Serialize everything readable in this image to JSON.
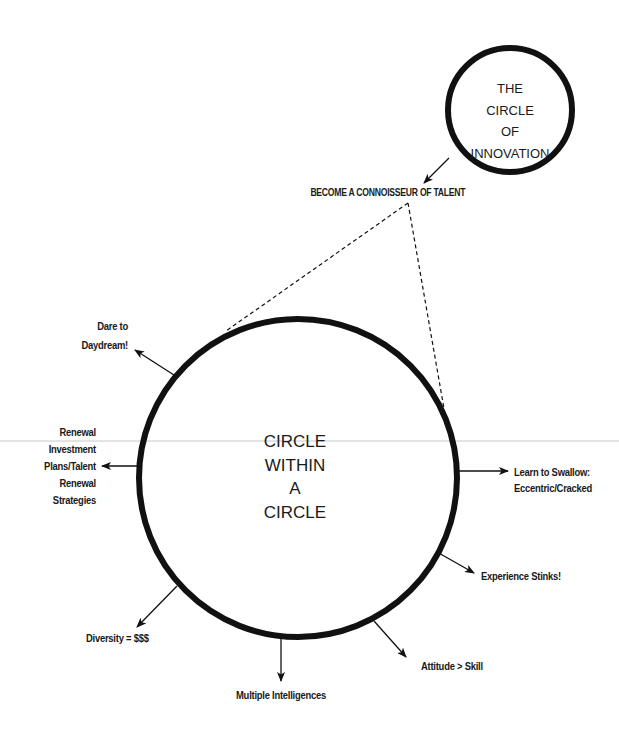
{
  "small_circle": {
    "lines": [
      "THE",
      "CIRCLE",
      "OF",
      "INNOVATION"
    ]
  },
  "connector_label": "BECOME A CONNOISSEUR OF TALENT",
  "big_circle": {
    "lines": [
      "CIRCLE",
      "WITHIN",
      "A",
      "CIRCLE"
    ]
  },
  "spokes": [
    {
      "id": "daydream",
      "lines": [
        "Dare to",
        "Daydream!"
      ]
    },
    {
      "id": "renewal",
      "lines": [
        "Renewal",
        "Investment",
        "Plans/Talent",
        "Renewal",
        "Strategies"
      ]
    },
    {
      "id": "swallow",
      "lines": [
        "Learn to Swallow:",
        "Eccentric/Cracked"
      ]
    },
    {
      "id": "experience",
      "lines": [
        "Experience Stinks!"
      ]
    },
    {
      "id": "attitude",
      "lines": [
        "Attitude > Skill"
      ]
    },
    {
      "id": "intelligences",
      "lines": [
        "Multiple Intelligences"
      ]
    },
    {
      "id": "diversity",
      "lines": [
        "Diversity = $$$"
      ]
    }
  ],
  "colors": {
    "ink": "#111111",
    "background": "#ffffff",
    "rule": "#c8c8c8"
  }
}
